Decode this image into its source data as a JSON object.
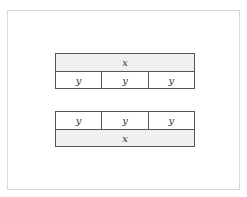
{
  "diagram": {
    "top_bar": {
      "whole_label": "x",
      "parts": [
        "y",
        "y",
        "y"
      ]
    },
    "bottom_bar": {
      "parts": [
        "y",
        "y",
        "y"
      ],
      "whole_label": "x"
    },
    "colors": {
      "whole_fill": "#f0f0f0",
      "part_fill": "#ffffff",
      "border": "#555555"
    }
  }
}
